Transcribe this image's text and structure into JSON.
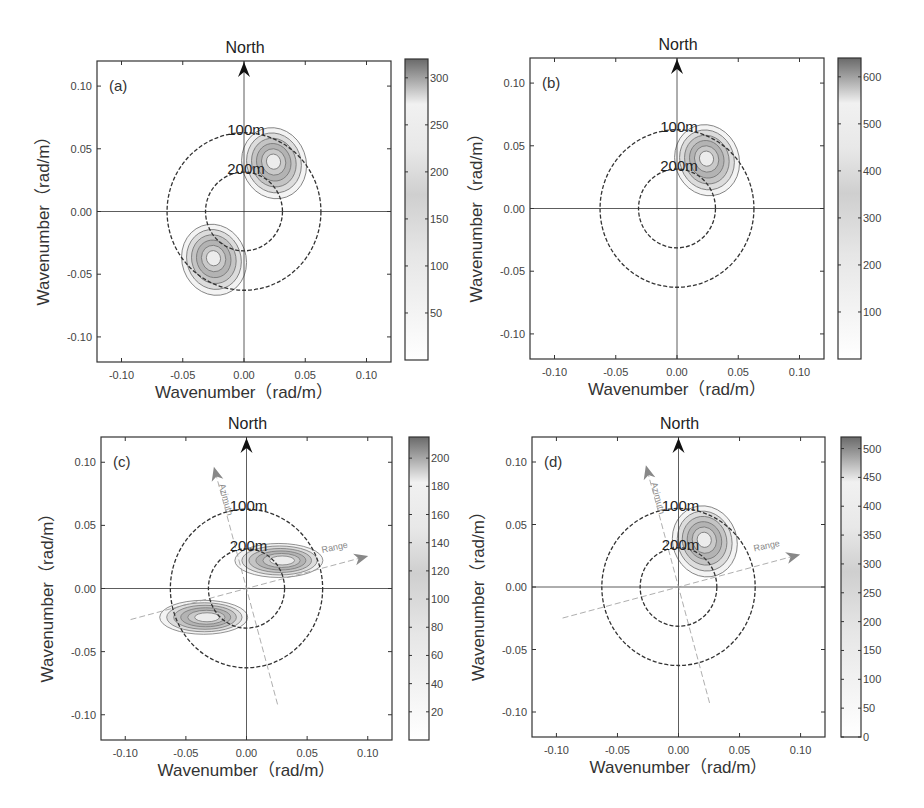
{
  "figure": {
    "north_label": "North",
    "xlabel": "Wavenumber（rad/m）",
    "ylabel": "Wavenumber（rad/m）",
    "ring_labels": [
      "100m",
      "200m"
    ],
    "axis_tick_labels": [
      "-0.10",
      "-0.05",
      "0.00",
      "0.05",
      "0.10"
    ],
    "azimuth_label": "Azimuth",
    "range_label": "Range"
  },
  "chart_data": [
    {
      "type": "heatmap",
      "panel": "(a)",
      "title": "North",
      "xlabel": "Wavenumber（rad/m）",
      "ylabel": "Wavenumber（rad/m）",
      "xlim": [
        -0.12,
        0.12
      ],
      "ylim": [
        -0.12,
        0.12
      ],
      "xticks": [
        -0.1,
        -0.05,
        0.0,
        0.05,
        0.1
      ],
      "yticks": [
        -0.1,
        -0.05,
        0.0,
        0.05,
        0.1
      ],
      "rings": [
        {
          "label": "100m",
          "radius": 0.0628
        },
        {
          "label": "200m",
          "radius": 0.0314
        }
      ],
      "peaks": [
        {
          "kx": 0.024,
          "ky": 0.04,
          "max": 320
        },
        {
          "kx": -0.025,
          "ky": -0.037,
          "max": 320
        }
      ],
      "colorbar": {
        "min": 0,
        "max": 320,
        "ticks": [
          50,
          100,
          150,
          200,
          250,
          300
        ]
      },
      "show_sar_axes": false
    },
    {
      "type": "heatmap",
      "panel": "(b)",
      "title": "North",
      "xlabel": "Wavenumber（rad/m）",
      "ylabel": "Wavenumber（rad/m）",
      "xlim": [
        -0.12,
        0.12
      ],
      "ylim": [
        -0.12,
        0.12
      ],
      "xticks": [
        -0.1,
        -0.05,
        0.0,
        0.05,
        0.1
      ],
      "yticks": [
        -0.1,
        -0.05,
        0.0,
        0.05,
        0.1
      ],
      "rings": [
        {
          "label": "100m",
          "radius": 0.0628
        },
        {
          "label": "200m",
          "radius": 0.0314
        }
      ],
      "peaks": [
        {
          "kx": 0.024,
          "ky": 0.04,
          "max": 640
        }
      ],
      "colorbar": {
        "min": 0,
        "max": 640,
        "ticks": [
          100,
          200,
          300,
          400,
          500,
          600
        ]
      },
      "show_sar_axes": false
    },
    {
      "type": "heatmap",
      "panel": "(c)",
      "title": "North",
      "xlabel": "Wavenumber（rad/m）",
      "ylabel": "Wavenumber（rad/m）",
      "xlim": [
        -0.12,
        0.12
      ],
      "ylim": [
        -0.12,
        0.12
      ],
      "xticks": [
        -0.1,
        -0.05,
        0.0,
        0.05,
        0.1
      ],
      "yticks": [
        -0.1,
        -0.05,
        0.0,
        0.05,
        0.1
      ],
      "rings": [
        {
          "label": "100m",
          "radius": 0.0628
        },
        {
          "label": "200m",
          "radius": 0.0314
        }
      ],
      "peaks": [
        {
          "kx": 0.03,
          "ky": 0.023,
          "max": 215
        },
        {
          "kx": -0.032,
          "ky": -0.022,
          "max": 215
        }
      ],
      "colorbar": {
        "min": 0,
        "max": 215,
        "ticks": [
          20,
          40,
          60,
          80,
          100,
          120,
          140,
          160,
          180,
          200
        ]
      },
      "show_sar_axes": true,
      "sar_axes": {
        "azimuth_label": "Azimuth",
        "range_label": "Range"
      }
    },
    {
      "type": "heatmap",
      "panel": "(d)",
      "title": "North",
      "xlabel": "Wavenumber（rad/m）",
      "ylabel": "Wavenumber（rad/m）",
      "xlim": [
        -0.12,
        0.12
      ],
      "ylim": [
        -0.12,
        0.12
      ],
      "xticks": [
        -0.1,
        -0.05,
        0.0,
        0.05,
        0.1
      ],
      "yticks": [
        -0.1,
        -0.05,
        0.0,
        0.05,
        0.1
      ],
      "rings": [
        {
          "label": "100m",
          "radius": 0.0628
        },
        {
          "label": "200m",
          "radius": 0.0314
        }
      ],
      "peaks": [
        {
          "kx": 0.021,
          "ky": 0.038,
          "max": 520
        }
      ],
      "colorbar": {
        "min": 0,
        "max": 520,
        "ticks": [
          0,
          50,
          100,
          150,
          200,
          250,
          300,
          350,
          400,
          450,
          500
        ]
      },
      "show_sar_axes": true,
      "sar_axes": {
        "azimuth_label": "Azimuth",
        "range_label": "Range"
      }
    }
  ],
  "layout": {
    "panels": [
      {
        "box": [
          97,
          61,
          294,
          301
        ],
        "cbar": [
          405,
          59,
          23,
          301
        ]
      },
      {
        "box": [
          530,
          58,
          294,
          301
        ],
        "cbar": [
          838,
          58,
          23,
          301
        ]
      },
      {
        "box": [
          101,
          437,
          291,
          303
        ],
        "cbar": [
          409,
          437,
          20,
          303
        ]
      },
      {
        "box": [
          532,
          437,
          293,
          300
        ],
        "cbar": [
          841,
          437,
          20,
          300
        ]
      }
    ]
  },
  "colors": {
    "axis": "#333333",
    "ring": "#333333",
    "sar_axis": "#999999",
    "contour_line": "#777777",
    "spectrum_dark": "#6e6e6e",
    "spectrum_mid": "#bcbcbc",
    "spectrum_light": "#ececec"
  }
}
